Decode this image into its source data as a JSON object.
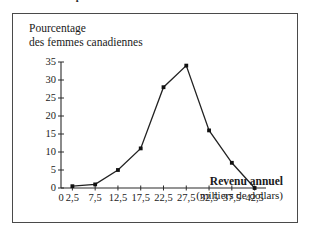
{
  "caption": {
    "text": "la répartition de leur revenu annuel en 1996"
  },
  "figure": {
    "y_axis_title_line1": "Pourcentage",
    "y_axis_title_line2": "des femmes canadiennes",
    "x_axis_title_line1": "Revenu annuel",
    "x_axis_title_line2": "(milliers de dollars)"
  },
  "chart_data": {
    "type": "line",
    "title": "",
    "xlabel": "Revenu annuel (milliers de dollars)",
    "ylabel": "Pourcentage des femmes canadiennes",
    "x": [
      2.5,
      7.5,
      12.5,
      17.5,
      22.5,
      27.5,
      32.5,
      37.5,
      42.5
    ],
    "x_tick_labels": [
      "0",
      "2,5",
      "7,5",
      "12,5",
      "17,5",
      "22,5",
      "27,5",
      "32,5",
      "37,5",
      "42,5"
    ],
    "y_tick_labels": [
      "0",
      "5",
      "10",
      "15",
      "20",
      "25",
      "30",
      "35"
    ],
    "values": [
      0.5,
      1.0,
      5.0,
      11.0,
      28.0,
      34.0,
      16.0,
      7.0,
      0.0
    ],
    "xlim": [
      0,
      45
    ],
    "ylim": [
      0,
      35
    ],
    "grid": false,
    "legend": "none",
    "marker": "square",
    "line_color": "#222222",
    "marker_color": "#111111"
  }
}
